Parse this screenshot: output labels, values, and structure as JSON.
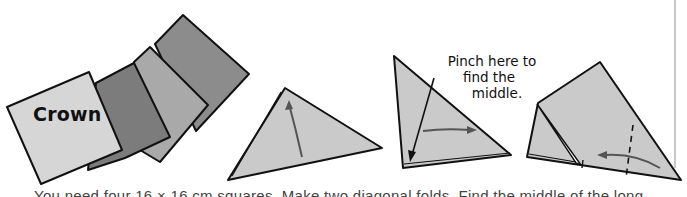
{
  "illustration": {
    "title": "Crown",
    "annotation": {
      "lines": [
        "Pinch here to",
        "find the",
        "middle."
      ]
    },
    "caption": "You need four 16 × 16 cm squares. Make two diagonal folds. Find the middle of the long",
    "colors": {
      "paper_light": "#d4d4d4",
      "paper_dark": "#7e7e7e",
      "paper_medium": "#a8a8a8",
      "paper_darker": "#8a8a8a",
      "fold_triangle": "#c9c9c9",
      "outline": "#111111",
      "arrow": "#555555",
      "divider": "#c8c8c8"
    },
    "steps": [
      {
        "name": "four-paper-squares"
      },
      {
        "name": "diagonal-fold-triangle"
      },
      {
        "name": "pinch-middle-triangle"
      },
      {
        "name": "fold-corner-to-middle"
      }
    ]
  }
}
